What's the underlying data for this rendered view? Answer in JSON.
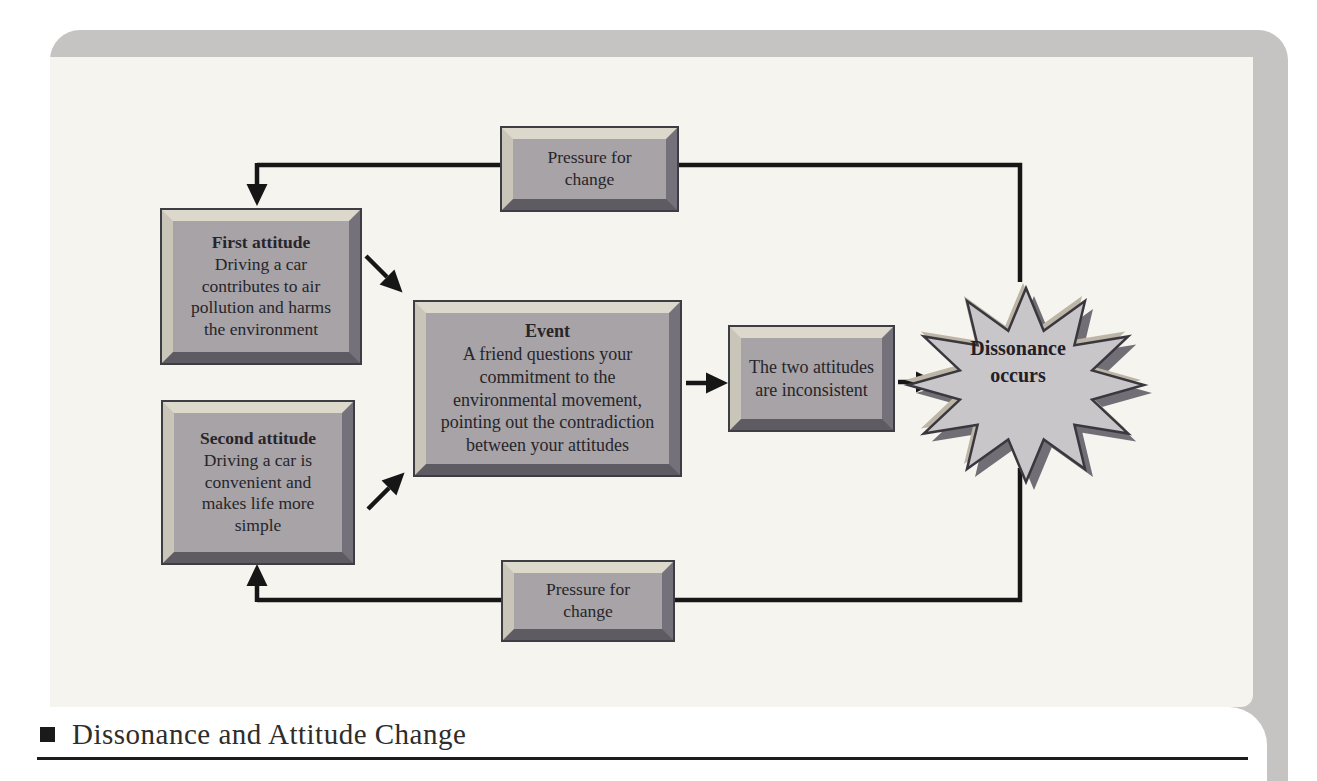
{
  "figure": {
    "type": "flow-diagram",
    "topic": "cognitive dissonance"
  },
  "nodes": {
    "pressure_top": {
      "body": "Pressure for change"
    },
    "first_attitude": {
      "title": "First attitude",
      "body": "Driving a car contributes to air pollution and harms the environment"
    },
    "second_attitude": {
      "title": "Second attitude",
      "body": "Driving a car is convenient and makes life more simple"
    },
    "event": {
      "title": "Event",
      "body": "A friend questions your commitment to the environmental movement, pointing out the contradiction between your attitudes"
    },
    "two_attitudes": {
      "body": "The two attitudes are inconsistent"
    },
    "dissonance": {
      "body": "Dissonance occurs"
    },
    "pressure_bottom": {
      "body": "Pressure for change"
    }
  },
  "caption": {
    "bullet_icon": "square-bullet-icon",
    "text": "Dissonance and Attitude Change"
  },
  "palette": {
    "page_background": "#ffffff",
    "panel_background": "#f6f4ee",
    "frame_band": "#c6c4c2",
    "box_fill": "#a7a3a6",
    "bevel_light": "#dcd8cc",
    "bevel_dark": "#5e5b63",
    "box_outline": "#3f3d44",
    "connector_line": "#161616",
    "starburst_fill": "#c9c6c9",
    "starburst_shadow": "#716e76",
    "starburst_highlight": "#bdb6a7",
    "text_color": "#26252b"
  }
}
